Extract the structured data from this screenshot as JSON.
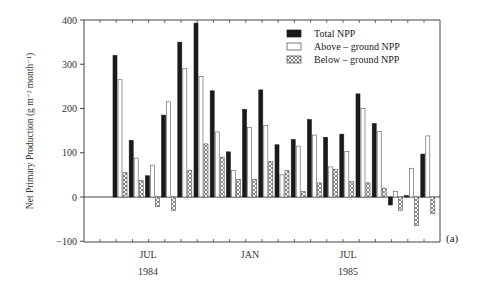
{
  "chart_data": {
    "type": "bar",
    "title": "",
    "panel_label": "(a)",
    "xlabel": "",
    "ylabel": "Net Primary Production (g m⁻² month⁻¹)",
    "ylim": [
      -100,
      400
    ],
    "yticks": [
      -100,
      0,
      100,
      200,
      300,
      400
    ],
    "grid": false,
    "legend_position": "upper right",
    "x_tick_labels": [
      {
        "month": "JUL",
        "year": "1984"
      },
      {
        "month": "JAN",
        "year": ""
      },
      {
        "month": "JUL",
        "year": "1985"
      }
    ],
    "categories": [
      "1",
      "2",
      "3",
      "4",
      "5",
      "6",
      "7",
      "8",
      "9",
      "10",
      "11",
      "12",
      "13",
      "14",
      "15",
      "16",
      "17",
      "18",
      "19",
      "20"
    ],
    "series": [
      {
        "name": "Total NPP",
        "style": "solid-black",
        "values": [
          320,
          128,
          48,
          185,
          350,
          393,
          240,
          102,
          198,
          242,
          118,
          130,
          175,
          135,
          142,
          233,
          166,
          -18,
          3,
          97
        ]
      },
      {
        "name": "Above –  ground NPP",
        "style": "open",
        "values": [
          265,
          88,
          72,
          215,
          290,
          272,
          147,
          60,
          157,
          162,
          50,
          115,
          140,
          68,
          103,
          200,
          148,
          12,
          65,
          138
        ]
      },
      {
        "name": "Below – ground NPP",
        "style": "cross-hatched",
        "values": [
          55,
          38,
          -22,
          -30,
          60,
          120,
          90,
          40,
          40,
          80,
          60,
          12,
          32,
          62,
          35,
          32,
          20,
          -30,
          -65,
          -38
        ]
      }
    ]
  },
  "legend": {
    "items": [
      {
        "label": "Total NPP"
      },
      {
        "label": "Above –  ground NPP"
      },
      {
        "label": "Below – ground NPP"
      }
    ]
  },
  "colors": {
    "total": "#1a1a1a",
    "above": "#ffffff",
    "below_stroke": "#555555",
    "axis": "#444444"
  }
}
